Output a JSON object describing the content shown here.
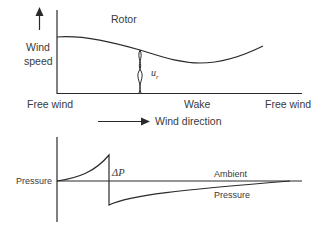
{
  "top_chart": {
    "title_label": "Rotor",
    "y_axis_label_line1": "Wind",
    "y_axis_label_line2": "speed",
    "velocity_label_base": "u",
    "velocity_label_sub": "r",
    "x_labels": [
      "Free wind",
      "Wake",
      "Free wind"
    ]
  },
  "direction": {
    "label": "Wind direction"
  },
  "bottom_chart": {
    "y_axis_label": "Pressure",
    "delta_label": "ΔP",
    "ambient_label_line1": "Ambient",
    "ambient_label_line2": "Pressure"
  },
  "colors": {
    "line": "#2a2a2a",
    "text": "#3a3a3a",
    "background": "#ffffff"
  }
}
